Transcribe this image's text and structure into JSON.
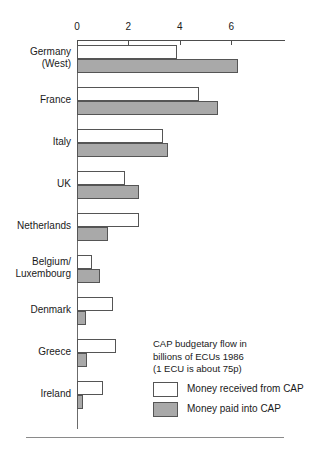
{
  "chart_data": {
    "type": "bar",
    "orientation": "horizontal",
    "title": "",
    "xlabel": "",
    "ylabel": "",
    "xlim": [
      0,
      8
    ],
    "xticks": [
      0,
      2,
      4,
      6
    ],
    "xtick_labels": [
      "0",
      "2",
      "4",
      "6"
    ],
    "grid": false,
    "legend_position": "inside-bottom-right",
    "unit_caption": "CAP budgetary flow in\nbillions of ECUs 1986\n(1 ECU is about 75p)",
    "categories": [
      "Germany\n(West)",
      "France",
      "Italy",
      "UK",
      "Netherlands",
      "Belgium/\nLuxembourg",
      "Denmark",
      "Greece",
      "Ireland"
    ],
    "series": [
      {
        "name": "Money received from CAP",
        "color": "#ffffff",
        "values": [
          3.9,
          4.75,
          3.35,
          1.85,
          2.4,
          0.6,
          1.4,
          1.5,
          1.0
        ]
      },
      {
        "name": "Money paid into CAP",
        "color": "#a9a9a9",
        "values": [
          6.25,
          5.5,
          3.55,
          2.4,
          1.2,
          0.9,
          0.35,
          0.4,
          0.25
        ]
      }
    ]
  },
  "axis": {
    "ticks": [
      {
        "label": "0",
        "value": 0
      },
      {
        "label": "2",
        "value": 2
      },
      {
        "label": "4",
        "value": 4
      },
      {
        "label": "6",
        "value": 6
      }
    ]
  },
  "legend": {
    "caption": "CAP budgetary flow in\nbillions of ECUs 1986\n(1 ECU is about 75p)",
    "items": [
      {
        "label": "Money received from CAP",
        "swatch": "received"
      },
      {
        "label": "Money paid into CAP",
        "swatch": "paid"
      }
    ]
  },
  "colors": {
    "paid_fill": "#a9a9a9",
    "received_fill": "#ffffff",
    "stroke": "#555555",
    "axis": "#4d4d4d",
    "text": "#1a1a1a"
  }
}
